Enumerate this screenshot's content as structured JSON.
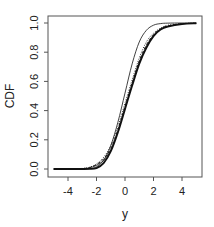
{
  "chart_data": {
    "type": "line",
    "title": "",
    "xlabel": "y",
    "ylabel": "CDF",
    "xlim": [
      -5,
      5
    ],
    "ylim": [
      0,
      1
    ],
    "grid": false,
    "legend": null,
    "x_ticks": [
      -4,
      -2,
      0,
      2,
      4
    ],
    "x_tick_labels": [
      "-4",
      "-2",
      "0",
      "2",
      "4"
    ],
    "y_ticks": [
      0.0,
      0.2,
      0.4,
      0.6,
      0.8,
      1.0
    ],
    "y_tick_labels": [
      "0.0",
      "0.2",
      "0.4",
      "0.6",
      "0.8",
      "1.0"
    ],
    "x": [
      -5,
      -4,
      -3,
      -2.5,
      -2,
      -1.5,
      -1,
      -0.5,
      0,
      0.5,
      1,
      1.5,
      2,
      2.5,
      3,
      4,
      5
    ],
    "series": [
      {
        "name": "curve-1 (thin solid, steep)",
        "style": "solid",
        "width": 0.8,
        "values": [
          0.0,
          0.0,
          0.0,
          0.002,
          0.015,
          0.06,
          0.16,
          0.32,
          0.52,
          0.72,
          0.87,
          0.95,
          0.985,
          0.996,
          0.999,
          1.0,
          1.0
        ]
      },
      {
        "name": "curve-2 (thick solid)",
        "style": "solid",
        "width": 1.8,
        "values": [
          0.0,
          0.0,
          0.0,
          0.001,
          0.006,
          0.04,
          0.12,
          0.25,
          0.41,
          0.57,
          0.72,
          0.83,
          0.91,
          0.955,
          0.975,
          0.993,
          0.998
        ]
      },
      {
        "name": "curve-3 (dashed)",
        "style": "dashed",
        "width": 0.9,
        "values": [
          0.0,
          0.0,
          0.003,
          0.01,
          0.03,
          0.07,
          0.14,
          0.27,
          0.43,
          0.59,
          0.74,
          0.85,
          0.92,
          0.96,
          0.98,
          0.995,
          0.999
        ]
      },
      {
        "name": "curve-4 (dotted)",
        "style": "dotted",
        "width": 0.9,
        "values": [
          0.0,
          0.0,
          0.004,
          0.012,
          0.035,
          0.08,
          0.16,
          0.29,
          0.45,
          0.61,
          0.76,
          0.87,
          0.93,
          0.965,
          0.985,
          0.996,
          0.999
        ]
      },
      {
        "name": "curve-5 (thin solid)",
        "style": "solid",
        "width": 0.8,
        "values": [
          0.0,
          0.0,
          0.002,
          0.008,
          0.025,
          0.06,
          0.13,
          0.26,
          0.42,
          0.58,
          0.73,
          0.84,
          0.915,
          0.958,
          0.978,
          0.994,
          0.998
        ]
      }
    ]
  }
}
